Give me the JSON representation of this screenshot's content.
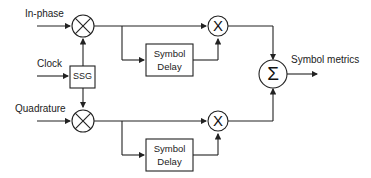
{
  "inputs": {
    "in_phase": "In-phase",
    "clock": "Clock",
    "quadrature": "Quadrature"
  },
  "blocks": {
    "ssg": "SSG",
    "delay_top_line1": "Symbol",
    "delay_top_line2": "Delay",
    "delay_bottom_line1": "Symbol",
    "delay_bottom_line2": "Delay",
    "multiplier_symbol": "X",
    "summer_symbol": "Σ"
  },
  "output": {
    "label": "Symbol metrics"
  },
  "colors": {
    "line": "#222222",
    "background": "#ffffff"
  }
}
